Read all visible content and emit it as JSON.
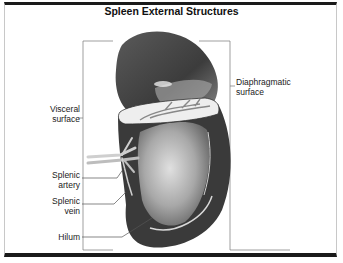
{
  "title": "Spleen External Structures",
  "labels": {
    "visceral": [
      "Visceral",
      "surface"
    ],
    "diaphragmatic": [
      "Diaphragmatic",
      "surface"
    ],
    "artery": [
      "Splenic",
      "artery"
    ],
    "vein": [
      "Splenic",
      "vein"
    ],
    "hilum": "Hilum"
  },
  "colors": {
    "organ_dark": "#3a3a3a",
    "organ_mid": "#7a7a7a",
    "organ_light": "#c9c9c9",
    "line": "#666666"
  }
}
